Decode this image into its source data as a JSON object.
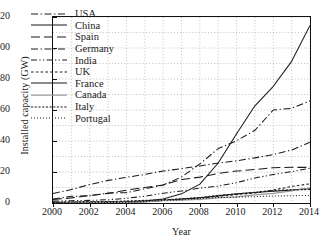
{
  "chart_data": {
    "type": "line",
    "title": "",
    "xlabel": "Year",
    "ylabel": "Installed capacity (GW)",
    "xlim": [
      2000,
      2014
    ],
    "ylim": [
      0,
      120
    ],
    "xticks": [
      2000,
      2002,
      2004,
      2006,
      2008,
      2010,
      2012,
      2014
    ],
    "yticks": [
      0,
      20,
      40,
      60,
      80,
      100,
      120
    ],
    "grid": true,
    "grid_style": "dotted",
    "legend_position": "upper-left",
    "x": [
      2000,
      2001,
      2002,
      2003,
      2004,
      2005,
      2006,
      2007,
      2008,
      2009,
      2010,
      2011,
      2012,
      2013,
      2014
    ],
    "series": [
      {
        "name": "USA",
        "style": "dash-dot",
        "color": "#1a1a1a",
        "values": [
          2.6,
          4.3,
          4.7,
          6.4,
          6.7,
          9.1,
          11.6,
          16.8,
          25.2,
          35.1,
          40.2,
          46.9,
          60.0,
          61.1,
          65.9
        ]
      },
      {
        "name": "China",
        "style": "solid",
        "color": "#1a1a1a",
        "values": [
          0.3,
          0.4,
          0.5,
          0.6,
          0.8,
          1.3,
          2.6,
          5.9,
          12.2,
          25.8,
          44.7,
          62.7,
          75.3,
          91.4,
          114.6
        ]
      },
      {
        "name": "Spain",
        "style": "long-dash",
        "color": "#1a1a1a",
        "values": [
          2.2,
          3.3,
          4.8,
          6.2,
          8.3,
          10.0,
          11.6,
          15.1,
          16.7,
          19.1,
          20.6,
          21.6,
          22.8,
          23.0,
          23.0
        ]
      },
      {
        "name": "Germany",
        "style": "dash-dot",
        "color": "#1a1a1a",
        "values": [
          6.1,
          8.7,
          11.9,
          14.6,
          16.6,
          18.4,
          20.6,
          22.2,
          23.9,
          25.8,
          27.2,
          29.1,
          31.3,
          34.2,
          39.2
        ]
      },
      {
        "name": "India",
        "style": "dash-dot-dot",
        "color": "#1a1a1a",
        "values": [
          1.2,
          1.5,
          1.7,
          2.1,
          3.0,
          4.4,
          6.3,
          7.8,
          9.6,
          10.9,
          13.1,
          16.1,
          18.4,
          20.2,
          22.5
        ]
      },
      {
        "name": "UK",
        "style": "dotted-dash",
        "color": "#1a1a1a",
        "values": [
          0.4,
          0.5,
          0.6,
          0.7,
          0.9,
          1.3,
          2.0,
          2.4,
          3.2,
          4.3,
          5.4,
          6.5,
          8.4,
          10.7,
          12.4
        ]
      },
      {
        "name": "France",
        "style": "solid",
        "color": "#1a1a1a",
        "values": [
          0.06,
          0.08,
          0.15,
          0.25,
          0.39,
          0.76,
          1.6,
          2.5,
          3.4,
          4.6,
          5.9,
          6.8,
          7.6,
          8.3,
          9.3
        ]
      },
      {
        "name": "Canada",
        "style": "solid-light",
        "color": "#9a9a9a",
        "values": [
          0.14,
          0.2,
          0.24,
          0.32,
          0.44,
          0.68,
          1.5,
          1.8,
          2.4,
          3.3,
          4.0,
          5.3,
          6.2,
          7.8,
          9.7
        ]
      },
      {
        "name": "Italy",
        "style": "fine-dash",
        "color": "#1a1a1a",
        "values": [
          0.37,
          0.68,
          0.79,
          0.9,
          1.3,
          1.7,
          2.1,
          2.7,
          3.5,
          4.9,
          5.8,
          6.9,
          8.1,
          8.5,
          8.7
        ]
      },
      {
        "name": "Portugal",
        "style": "dotted",
        "color": "#1a1a1a",
        "values": [
          0.1,
          0.13,
          0.19,
          0.3,
          0.52,
          1.0,
          1.7,
          2.1,
          2.9,
          3.5,
          3.8,
          4.1,
          4.5,
          4.7,
          4.9
        ]
      }
    ]
  }
}
